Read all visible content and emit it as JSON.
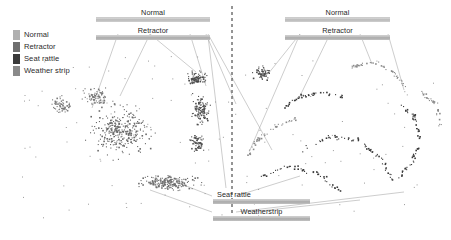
{
  "figure": {
    "type": "scatter",
    "background": "#ffffff",
    "point_color": "#555555",
    "divider": {
      "orientation": "vertical",
      "x": 232,
      "style": "dashed",
      "color": "#2a2a2a"
    }
  },
  "legend": {
    "items": [
      {
        "label": "Normal",
        "color": "#b0b0b0"
      },
      {
        "label": "Retractor",
        "color": "#6f6f6f"
      },
      {
        "label": "Seat rattle",
        "color": "#3a3a3a"
      },
      {
        "label": "Weather strip",
        "color": "#8a8a8a"
      }
    ]
  },
  "annotations": {
    "top_left": [
      {
        "label": "Normal"
      },
      {
        "label": "Retractor"
      }
    ],
    "top_right": [
      {
        "label": "Normal"
      },
      {
        "label": "Retractor"
      }
    ],
    "bottom_center": [
      {
        "label": "Seat rattle"
      },
      {
        "label": "Weatherstrip"
      }
    ]
  },
  "chart_data": {
    "type": "scatter",
    "title": "",
    "xlabel": "",
    "ylabel": "",
    "xlim": [
      0,
      451
    ],
    "ylim": [
      0,
      235
    ],
    "grid": false,
    "legend_position": "top-left",
    "axes_visible": false,
    "tick_labels": [],
    "series": [
      {
        "name": "Normal",
        "color": "#b0b0b0",
        "marker": "dot",
        "description": "Large diffuse cloud occupying the left-centre of the panel plus a second elongated cloud at lower-centre.",
        "n_points": 620,
        "clusters": [
          {
            "cx": 120,
            "cy": 130,
            "rx": 46,
            "ry": 34,
            "n": 300,
            "shade": "#6a6a6a"
          },
          {
            "cx": 168,
            "cy": 182,
            "rx": 42,
            "ry": 13,
            "n": 190,
            "shade": "#6f6f6f"
          },
          {
            "cx": 60,
            "cy": 105,
            "rx": 16,
            "ry": 16,
            "n": 55,
            "shade": "#7a7a7a"
          },
          {
            "cx": 96,
            "cy": 96,
            "rx": 22,
            "ry": 14,
            "n": 75,
            "shade": "#777777"
          }
        ]
      },
      {
        "name": "Retractor",
        "color": "#6f6f6f",
        "marker": "dot",
        "description": "Vertical dense band just left of the centre divider, from about y=60 to y=150.",
        "n_points": 300,
        "clusters": [
          {
            "cx": 196,
            "cy": 78,
            "rx": 16,
            "ry": 12,
            "n": 85,
            "shade": "#4a4a4a"
          },
          {
            "cx": 200,
            "cy": 110,
            "rx": 14,
            "ry": 22,
            "n": 110,
            "shade": "#4f4f4f"
          },
          {
            "cx": 196,
            "cy": 143,
            "rx": 13,
            "ry": 14,
            "n": 70,
            "shade": "#545454"
          },
          {
            "cx": 262,
            "cy": 72,
            "rx": 14,
            "ry": 11,
            "n": 60,
            "shade": "#4d4d4d"
          }
        ]
      },
      {
        "name": "Seat rattle",
        "color": "#3a3a3a",
        "marker": "dot",
        "description": "Thin curved ribbon trails sweeping across the right half of the panel.",
        "n_points": 260,
        "arcs": [
          {
            "points": [
              [
                300,
                150
              ],
              [
                330,
                136
              ],
              [
                358,
                140
              ],
              [
                380,
                158
              ],
              [
                392,
                180
              ]
            ],
            "n": 60
          },
          {
            "points": [
              [
                256,
                178
              ],
              [
                286,
                166
              ],
              [
                316,
                172
              ],
              [
                340,
                190
              ]
            ],
            "n": 45
          },
          {
            "points": [
              [
                398,
                104
              ],
              [
                414,
                116
              ],
              [
                420,
                140
              ],
              [
                410,
                164
              ],
              [
                396,
                178
              ]
            ],
            "n": 55
          },
          {
            "points": [
              [
                282,
                108
              ],
              [
                300,
                96
              ],
              [
                322,
                92
              ],
              [
                346,
                98
              ]
            ],
            "n": 40
          }
        ]
      },
      {
        "name": "Weather strip",
        "color": "#8a8a8a",
        "marker": "dot",
        "description": "Sparse curved strands across the upper right and far right margin.",
        "n_points": 200,
        "arcs": [
          {
            "points": [
              [
                352,
                66
              ],
              [
                372,
                62
              ],
              [
                392,
                70
              ],
              [
                404,
                86
              ]
            ],
            "n": 45
          },
          {
            "points": [
              [
                296,
                118
              ],
              [
                276,
                126
              ],
              [
                256,
                140
              ],
              [
                246,
                158
              ]
            ],
            "n": 40
          },
          {
            "points": [
              [
                420,
                92
              ],
              [
                436,
                104
              ],
              [
                440,
                126
              ]
            ],
            "n": 30
          }
        ]
      }
    ]
  }
}
